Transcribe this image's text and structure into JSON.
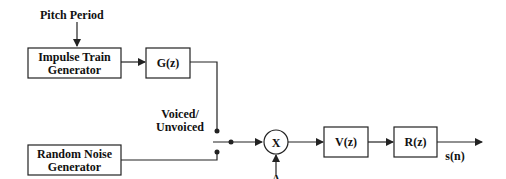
{
  "diagram": {
    "inputs": {
      "pitch_period": "Pitch Period",
      "gain": "A"
    },
    "blocks": {
      "impulse_train": [
        "Impulse Train",
        "Generator"
      ],
      "glottal_filter": "G(z)",
      "random_noise": [
        "Random Noise",
        "Generator"
      ],
      "multiplier": "X",
      "vocal_tract": "V(z)",
      "radiation": "R(z)"
    },
    "switch_label": [
      "Voiced/",
      "Unvoiced"
    ],
    "output": "s(n)",
    "colors": {
      "stroke": "#222222",
      "text": "#111111",
      "background": "#ffffff"
    }
  }
}
